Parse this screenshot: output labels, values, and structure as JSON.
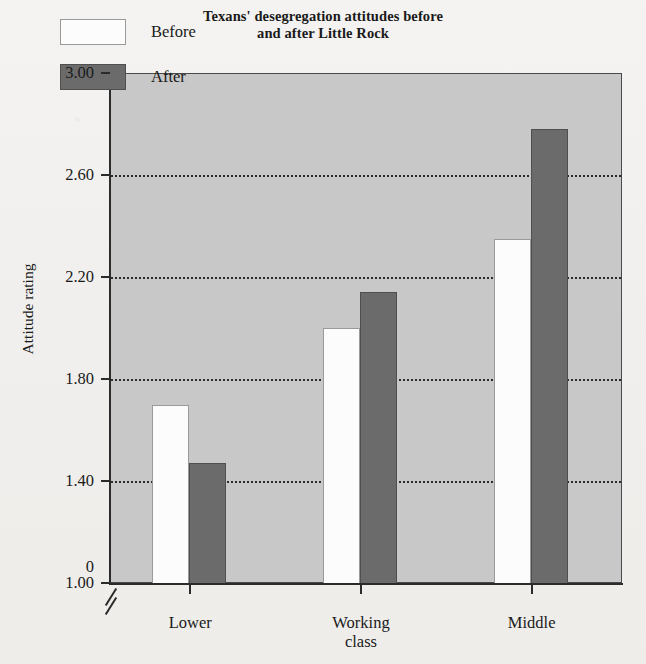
{
  "chart_data": {
    "type": "bar",
    "title": "Texans' desegregation attitudes before and after Little Rock",
    "title_lines": [
      "Texans' desegregation attitudes before",
      "and after Little Rock"
    ],
    "xlabel": "",
    "ylabel": "Attitude rating",
    "categories": [
      "Lower",
      "Working class",
      "Middle"
    ],
    "category_lines": [
      [
        "Lower"
      ],
      [
        "Working",
        "class"
      ],
      [
        "Middle"
      ]
    ],
    "series": [
      {
        "name": "Before",
        "color": "#fcfcfc",
        "values": [
          1.7,
          2.0,
          2.35
        ]
      },
      {
        "name": "After",
        "color": "#6b6b6b",
        "values": [
          1.47,
          2.14,
          2.78
        ]
      }
    ],
    "ylim": [
      1.0,
      3.0
    ],
    "y_ticks": [
      3.0,
      2.6,
      2.2,
      1.8,
      1.4,
      1.0
    ],
    "y_tick_labels": [
      "3.00",
      "2.60",
      "2.20",
      "1.80",
      "1.40",
      "1.00"
    ],
    "y_origin_label": "0",
    "axis_break": true,
    "gridlines": [
      2.6,
      2.2,
      1.8,
      1.4
    ],
    "grid": true,
    "legend_position": "top-left",
    "plot_background": "#c8c8c8"
  }
}
